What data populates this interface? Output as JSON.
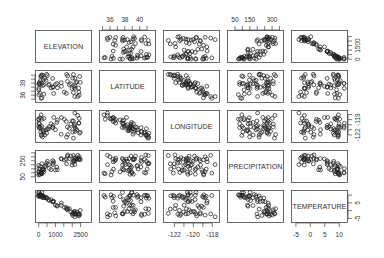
{
  "chart_data": {
    "type": "scatter",
    "subtype": "pairs_matrix",
    "title": "",
    "variables": [
      "ELEVATION",
      "LATITUDE",
      "LONGITUDE",
      "PRECIPITATION",
      "TEMPERATURE"
    ],
    "ranges": {
      "ELEVATION": [
        -100,
        3000
      ],
      "LATITUDE": [
        34.8,
        41.8
      ],
      "LONGITUDE": [
        -123,
        -117.5
      ],
      "PRECIPITATION": [
        10,
        360
      ],
      "TEMPERATURE": [
        -6,
        12
      ]
    },
    "axis_ticks": {
      "ELEVATION": {
        "side": "bottom/right",
        "labels": [
          "0",
          "1000",
          "2500"
        ],
        "right_labels": [
          "0",
          "1500"
        ],
        "values": [
          0,
          500,
          1000,
          1500,
          2000,
          2500
        ],
        "right_values": [
          0,
          500,
          1000,
          1500,
          2000,
          2500
        ]
      },
      "LATITUDE": {
        "side": "top/left",
        "labels": [
          "36",
          "38",
          "40"
        ],
        "left_labels": [
          "36",
          "39"
        ],
        "values": [
          35,
          36,
          37,
          38,
          39,
          40,
          41
        ]
      },
      "LONGITUDE": {
        "side": "bottom/right",
        "labels": [
          "-122",
          "-120",
          "-118"
        ],
        "right_labels": [
          "-122",
          "-119"
        ],
        "values": [
          -122,
          -121,
          -120,
          -119,
          -118
        ]
      },
      "PRECIPITATION": {
        "side": "top/left",
        "labels": [
          "50",
          "150",
          "300"
        ],
        "left_labels": [
          "50",
          "250"
        ],
        "values": [
          50,
          100,
          150,
          200,
          250,
          300,
          350
        ]
      },
      "TEMPERATURE": {
        "side": "bottom/right",
        "labels": [
          "-5",
          "0",
          "5",
          "10"
        ],
        "right_labels": [
          "-5",
          "5"
        ],
        "values": [
          -5,
          0,
          5,
          10
        ]
      }
    },
    "correlations_observed": {
      "ELEVATION~TEMPERATURE": "strong negative",
      "LATITUDE~LONGITUDE": "strong negative",
      "ELEVATION~PRECIPITATION": "weak positive",
      "LATITUDE~ELEVATION": "weak",
      "LONGITUDE~TEMPERATURE": "weak"
    },
    "n_points": 60,
    "seed": 7,
    "grid": false,
    "legend": null,
    "marker": "open-circle"
  },
  "labels": {
    "elevation": "ELEVATION",
    "latitude": "LATITUDE",
    "longitude": "LONGITUDE",
    "precipitation": "PRECIPITATION",
    "temperature": "TEMPERATURE"
  }
}
